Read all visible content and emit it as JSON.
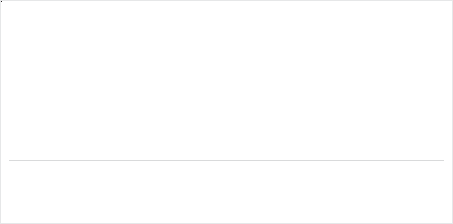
{
  "header": {
    "subtitle": "Billion €; Percentage"
  },
  "legend": {
    "items": [
      {
        "label": "Street food",
        "color": "#ffffff",
        "icon": "square-outline-icon"
      },
      {
        "label": "Cafés and bars",
        "color": "#c9cacc",
        "icon": "square-light-icon"
      },
      {
        "label": "Quick service restaurants",
        "color": "#9b9da0",
        "icon": "square-mid-icon"
      },
      {
        "label": "Full service restaurants",
        "color": "#808285",
        "icon": "square-dark-icon"
      }
    ]
  },
  "highlight": {
    "category": "South Korea",
    "color": "#231f20"
  },
  "chart_data": {
    "type": "bar",
    "subtitle": "Billion €; Percentage",
    "xlabel": "",
    "ylabel": "",
    "ylim": [
      0,
      100
    ],
    "grid": false,
    "legend_position": "bottom",
    "stacked": true,
    "categories": [
      "China",
      "USA",
      "Japan",
      "India",
      "Brazil",
      "Spain",
      "Italy",
      "UK",
      "South Korea",
      "France",
      "Germany",
      "ROW",
      "Total"
    ],
    "totals": [
      "641",
      "536",
      "180",
      "119",
      "97",
      "81",
      "79",
      "71",
      "77",
      "52",
      "46",
      "818",
      "2,803"
    ],
    "flags": [
      "f-china",
      "f-usa",
      "f-japan",
      "f-india",
      "f-brazil",
      "f-spain",
      "f-italy",
      "f-uk",
      "f-korea",
      "f-france",
      "f-germany",
      "",
      ""
    ],
    "series": [
      {
        "name": "Street food",
        "color": "#ffffff",
        "values": [
          3,
          1,
          1,
          2,
          1,
          1,
          1,
          1,
          1,
          1,
          1,
          4,
          2
        ],
        "labels": [
          "3%",
          "1%",
          "1%",
          "2%",
          "1%",
          "1%",
          "1%",
          "1%",
          "1%",
          "1%",
          "1%",
          "4%",
          "2%"
        ]
      },
      {
        "name": "Cafés and bars",
        "color": "#c9cacc",
        "values": [
          22,
          11,
          21,
          25,
          12,
          10,
          20,
          9,
          19,
          14,
          22,
          9,
          17
        ],
        "labels": [
          "22%",
          "11%",
          "21%",
          "25%",
          "12%",
          "10%",
          "20%",
          "9%",
          "19%",
          "14%",
          "22%",
          "9%",
          "17%"
        ]
      },
      {
        "name": "Quick service restaurants",
        "color": "#9b9da0",
        "values": [
          21,
          45,
          23,
          21,
          43,
          39,
          16,
          31,
          22,
          25,
          22,
          26,
          25
        ],
        "labels": [
          "21%",
          "45%",
          "23%",
          "21%",
          "43%",
          "39%",
          "16%",
          "31%",
          "22%",
          "25%",
          "22%",
          "26%",
          "25%"
        ]
      },
      {
        "name": "Full service restaurants",
        "color": "#808285",
        "values": [
          54,
          43,
          55,
          52,
          44,
          50,
          63,
          59,
          58,
          60,
          55,
          61,
          56
        ],
        "labels": [
          "54%",
          "43%",
          "55%",
          "52%",
          "44%",
          "50%",
          "63%",
          "59%",
          "58%",
          "60%",
          "55%",
          "61%",
          "56%"
        ]
      }
    ],
    "connector_line": {
      "name": "quick-service boundary",
      "color": "#939598",
      "values": [
        75,
        44,
        45,
        47,
        56,
        49,
        37,
        40,
        41,
        41,
        45,
        39,
        43
      ]
    }
  }
}
